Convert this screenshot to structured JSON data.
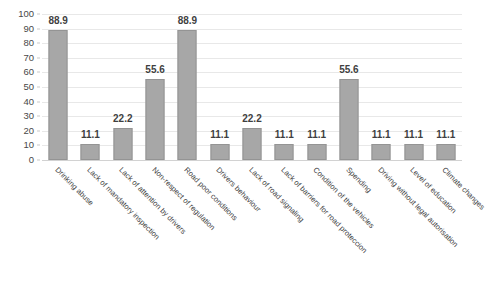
{
  "chart_data": {
    "type": "bar",
    "title": "",
    "subtitle": "",
    "xlabel": "",
    "ylabel": "",
    "ylim": [
      0,
      100
    ],
    "ytick_step": 10,
    "yticks": [
      "0",
      "10",
      "20",
      "30",
      "40",
      "50",
      "60",
      "70",
      "80",
      "90",
      "100"
    ],
    "grid": true,
    "grid_axis": "y",
    "legend": false,
    "legend_position": "none",
    "bar_color": "#a7a7a7",
    "bar_border_color": "#949494",
    "gridline_color": "#e8e8e8",
    "data_labels": true,
    "xtick_rotation": 45,
    "categories": [
      "Drinking abuse",
      "Lack of mandatory inspection",
      "Lack of attention by drivers",
      "Non-respect of regulation",
      "Road poor conditions",
      "Drivers behaviour",
      "Lack of road signaling",
      "Lack of barriers for road proteccion",
      "Condition of the vehicles",
      "Spending",
      "Driving without legal autorisation",
      "Level of education",
      "Climate changes"
    ],
    "values": [
      88.9,
      11.1,
      22.2,
      55.6,
      88.9,
      11.1,
      22.2,
      11.1,
      11.1,
      55.6,
      11.1,
      11.1,
      11.1
    ],
    "value_labels": [
      "88.9",
      "11.1",
      "22.2",
      "55.6",
      "88.9",
      "11.1",
      "22.2",
      "11.1",
      "11.1",
      "55.6",
      "11.1",
      "11.1",
      "11.1"
    ]
  }
}
